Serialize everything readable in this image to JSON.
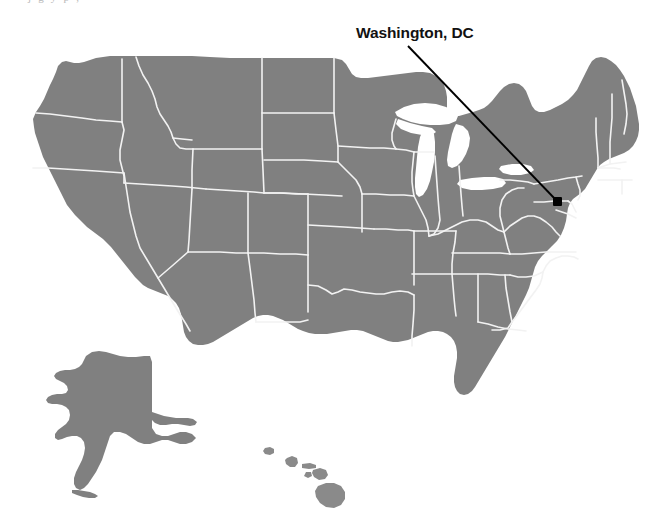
{
  "figure": {
    "type": "map",
    "background_color": "#ffffff",
    "land_fill_color": "#808080",
    "state_border_color": "#f2f2f2",
    "annotation_color": "#121212",
    "top_caption_fragment": "j g y p ,"
  },
  "annotation": {
    "label": "Washington, DC",
    "marker_name": "washington-dc-marker",
    "marker_color": "#000000",
    "marker_point": {
      "x": 558,
      "y": 202
    },
    "leader_line": {
      "x1": 408,
      "y1": 46,
      "x2": 556,
      "y2": 200
    }
  },
  "insets": {
    "alaska": {
      "name": "Alaska"
    },
    "hawaii": {
      "name": "Hawaii"
    }
  },
  "map_regions": {
    "contiguous": "contiguous-united-states",
    "great_lakes": "great-lakes"
  }
}
